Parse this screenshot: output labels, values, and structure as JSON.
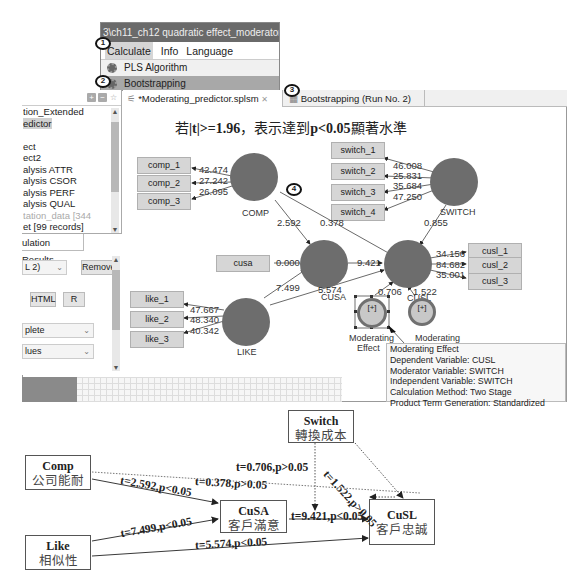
{
  "menu_window": {
    "title": "3\\ch11_ch12 quadratic effect_moderator",
    "menu_bar": [
      "Calculate",
      "Info",
      "Language"
    ],
    "items": [
      {
        "label": "PLS Algorithm",
        "icon": "gear-icon"
      },
      {
        "label": "Bootstrapping",
        "icon": "bootstrap-icon",
        "selected": true
      }
    ]
  },
  "badges": [
    "1",
    "2",
    "3",
    "4"
  ],
  "project_explorer": {
    "toolbar": [
      "plus-icon",
      "minus-icon",
      "star-icon"
    ],
    "items": [
      {
        "label": "tion_Extended"
      },
      {
        "label": "edictor",
        "selected": true
      },
      {
        "label": ""
      },
      {
        "label": "ect"
      },
      {
        "label": "ect2"
      },
      {
        "label": "alysis ATTR"
      },
      {
        "label": "alysis CSOR"
      },
      {
        "label": "alysis PERF"
      },
      {
        "label": "alysis QUAL"
      },
      {
        "label": "tation_data [344",
        "muted": true
      },
      {
        "label": "et [99 records]"
      }
    ]
  },
  "results_panel": {
    "tab": "ulation Results",
    "run_select": "L 2)",
    "remove_button": "Remove",
    "html_button": "HTML",
    "r_button": "R",
    "select1": "plete",
    "select2": "lues"
  },
  "editor_tabs": [
    {
      "label": "*Moderating_predictor.splsm",
      "close": "✕",
      "active": true
    },
    {
      "label": "Bootstrapping (Run No. 2)",
      "active": false
    }
  ],
  "canvas": {
    "headline_parts": [
      "若",
      "|t|>=1.96",
      "，表示達到",
      "p<0.05",
      "顯著水準"
    ],
    "indicators": {
      "comp": [
        "comp_1",
        "comp_2",
        "comp_3"
      ],
      "switch": [
        "switch_1",
        "switch_2",
        "switch_3",
        "switch_4"
      ],
      "cusa": [
        "cusa"
      ],
      "like": [
        "like_1",
        "like_2",
        "like_3"
      ],
      "cusl": [
        "cusl_1",
        "cusl_2",
        "cusl_3"
      ]
    },
    "latent_labels": {
      "comp": "COMP",
      "switch": "SWITCH",
      "cusa": "CUSA",
      "like": "LIKE",
      "cusl": "CUSL",
      "mod1": "Moderating Effect",
      "mod1_a": "Moderating",
      "mod1_b": "Effect",
      "mod2": "Moderating"
    },
    "loadings": {
      "comp": [
        "42.474",
        "27.242",
        "26.095"
      ],
      "switch": [
        "46.008",
        "25.831",
        "35.684",
        "47.250"
      ],
      "cusa": [
        "0.000"
      ],
      "like": [
        "47.667",
        "48.340",
        "40.342"
      ],
      "cusl": [
        "34.156",
        "84.682",
        "35.001"
      ]
    },
    "paths": {
      "comp_cusa": "2.592",
      "comp_cusl": "0.378",
      "switch_cusl": "0.855",
      "cusa_cusl": "9.421",
      "like_cusa": "7.499",
      "like_cusl": "5.574",
      "mod1_cusl": "0.706",
      "mod2_cusl": "1.522"
    },
    "mod_node_glyph": "[+]",
    "tooltip": {
      "title": "Moderating Effect",
      "lines": [
        "Dependent Variable: CUSL",
        "Moderator Variable: SWITCH",
        "Independent Variable: SWITCH",
        "Calculation Method: Two Stage",
        "Product Term Generation: Standardized"
      ]
    }
  },
  "summary_diagram": {
    "nodes": {
      "comp": {
        "en": "Comp",
        "zh": "公司能耐"
      },
      "like": {
        "en": "Like",
        "zh": "相似性"
      },
      "cusa": {
        "en": "CuSA",
        "zh": "客戶滿意"
      },
      "switch": {
        "en": "Switch",
        "zh": "轉換成本"
      },
      "cusl": {
        "en": "CuSL",
        "zh": "客戶忠誠"
      }
    },
    "edges": {
      "comp_cusa": "t=2.592,p<0.05",
      "comp_cusl": "t=0.378,p>0.05",
      "like_cusa": "t=7.499,p<0.05",
      "like_cusl": "t=5.574,p<0.05",
      "cusa_cusl": "t=9.421,p<0.05",
      "moderation": "t=0.706,p>0.05",
      "switch_cusl": "t=1.522,p>0.05"
    }
  }
}
